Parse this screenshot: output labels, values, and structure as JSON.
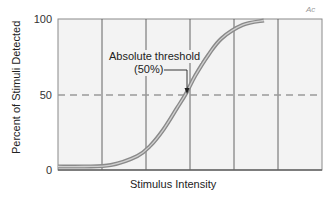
{
  "chart_data": {
    "type": "line",
    "title": "",
    "xlabel": "Stimulus Intensity",
    "ylabel": "Percent of Stimuli Detected",
    "yticks": [
      0,
      50,
      100
    ],
    "ylim": [
      0,
      100
    ],
    "xticks": [],
    "grid": {
      "vertical_lines": 5,
      "horizontal": false
    },
    "reference_line": {
      "y": 50,
      "style": "dashed",
      "color": "#9a9a9a"
    },
    "annotation": {
      "line1": "Absolute threshold",
      "line2": "(50%)",
      "points_to": {
        "x_frac": 0.485,
        "y": 50
      }
    },
    "series": [
      {
        "name": "Psychometric function",
        "x": [
          0,
          0.1,
          0.2,
          0.3,
          0.35,
          0.4,
          0.45,
          0.485,
          0.52,
          0.57,
          0.62,
          0.7,
          0.78
        ],
        "values": [
          1,
          1,
          2,
          8,
          15,
          26,
          40,
          50,
          62,
          76,
          87,
          96,
          99
        ]
      }
    ],
    "colors": {
      "curve": "#8a8a8a",
      "plot_bg": "#f3f3f3",
      "frame": "#777777"
    }
  },
  "labels": {
    "y100": "100",
    "y50": "50",
    "y0": "0",
    "ytitle": "Percent of Stimuli Detected",
    "xtitle": "Stimulus Intensity",
    "annot1": "Absolute threshold",
    "annot2": "(50%)",
    "mark": "Ac"
  }
}
